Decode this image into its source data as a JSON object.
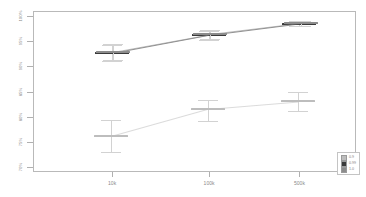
{
  "chart_data": {
    "type": "line",
    "title": "",
    "subtitle": "",
    "xlabel": "",
    "ylabel": "",
    "categories": [
      "10k",
      "100k",
      "500k"
    ],
    "x_tick_labels": [
      "10k",
      "100k",
      "500k"
    ],
    "y_tick_labels": [
      "100%",
      "95%",
      "90%",
      "85%",
      "80%",
      "75%",
      "70%"
    ],
    "y_tick_values": [
      100,
      95,
      90,
      85,
      80,
      75,
      70
    ],
    "ylim": [
      69,
      101
    ],
    "grid": false,
    "legend_position": "lower right",
    "error_bars": "whisker-with-caps",
    "marker_style": "horizontal-mean-bar",
    "series": [
      {
        "name": "0.9",
        "color": "#bdbdbd",
        "values": [
          76.2,
          81.6,
          83.1
        ],
        "err_low": [
          73.0,
          79.2,
          81.2
        ],
        "err_high": [
          79.4,
          83.4,
          85.0
        ]
      },
      {
        "name": "0.99",
        "color": "#3a3a3a",
        "values": [
          92.6,
          96.2,
          98.5
        ],
        "err_low": [
          91.1,
          95.3,
          98.0
        ],
        "err_high": [
          94.2,
          97.0,
          99.0
        ]
      },
      {
        "name": "1.0",
        "color": "#8c8c8c",
        "values": [
          92.9,
          96.4,
          98.6
        ],
        "err_low": [
          91.3,
          95.5,
          98.1
        ],
        "err_high": [
          94.4,
          97.2,
          99.1
        ]
      }
    ]
  },
  "legend": {
    "entries": [
      {
        "label": "0.9",
        "swatch": "#bdbdbd"
      },
      {
        "label": "0.99",
        "swatch": "#3a3a3a"
      },
      {
        "label": "1.0",
        "swatch": "#8c8c8c"
      }
    ]
  },
  "axes": {
    "frame_color": "#b9b9b9",
    "tick_color": "#b0b0b0",
    "tick_label_color": "#8a8a8a"
  }
}
